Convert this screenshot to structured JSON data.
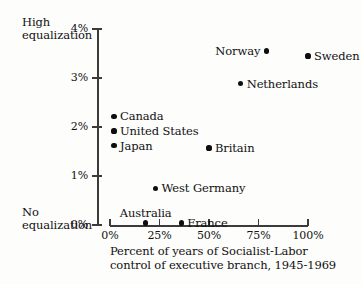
{
  "chart_data": {
    "type": "scatter",
    "title": "",
    "xlabel": "Percent of years of Socialist-Labor\ncontrol of executive branch, 1945-1969",
    "ylabel": "",
    "xlim": [
      0,
      100
    ],
    "ylim": [
      0,
      4
    ],
    "grid": false,
    "legend": "none",
    "x_ticks": [
      {
        "value": 0,
        "label": "0%"
      },
      {
        "value": 25,
        "label": "25%"
      },
      {
        "value": 50,
        "label": "50%"
      },
      {
        "value": 75,
        "label": "75%"
      },
      {
        "value": 100,
        "label": "100%"
      }
    ],
    "y_ticks": [
      {
        "value": 0,
        "label": "0%"
      },
      {
        "value": 1,
        "label": "1%"
      },
      {
        "value": 2,
        "label": "2%"
      },
      {
        "value": 3,
        "label": "3%"
      },
      {
        "value": 4,
        "label": "4%"
      }
    ],
    "y_axis_anchor_high": "High\nequalization",
    "y_axis_anchor_low": "No\nequalization",
    "points": [
      {
        "label": "Sweden",
        "x": 100,
        "y": 3.45,
        "label_side": "right"
      },
      {
        "label": "Norway",
        "x": 79,
        "y": 3.55,
        "label_side": "left"
      },
      {
        "label": "Netherlands",
        "x": 66,
        "y": 2.88,
        "label_side": "right"
      },
      {
        "label": "Canada",
        "x": 2,
        "y": 2.22,
        "label_side": "right"
      },
      {
        "label": "United States",
        "x": 2,
        "y": 1.92,
        "label_side": "right"
      },
      {
        "label": "Japan",
        "x": 2,
        "y": 1.62,
        "label_side": "right"
      },
      {
        "label": "Britain",
        "x": 50,
        "y": 1.57,
        "label_side": "right"
      },
      {
        "label": "West Germany",
        "x": 23,
        "y": 0.75,
        "label_side": "right"
      },
      {
        "label": "Australia",
        "x": 18,
        "y": 0.04,
        "label_side": "above"
      },
      {
        "label": "France",
        "x": 36,
        "y": 0.04,
        "label_side": "right"
      }
    ]
  }
}
